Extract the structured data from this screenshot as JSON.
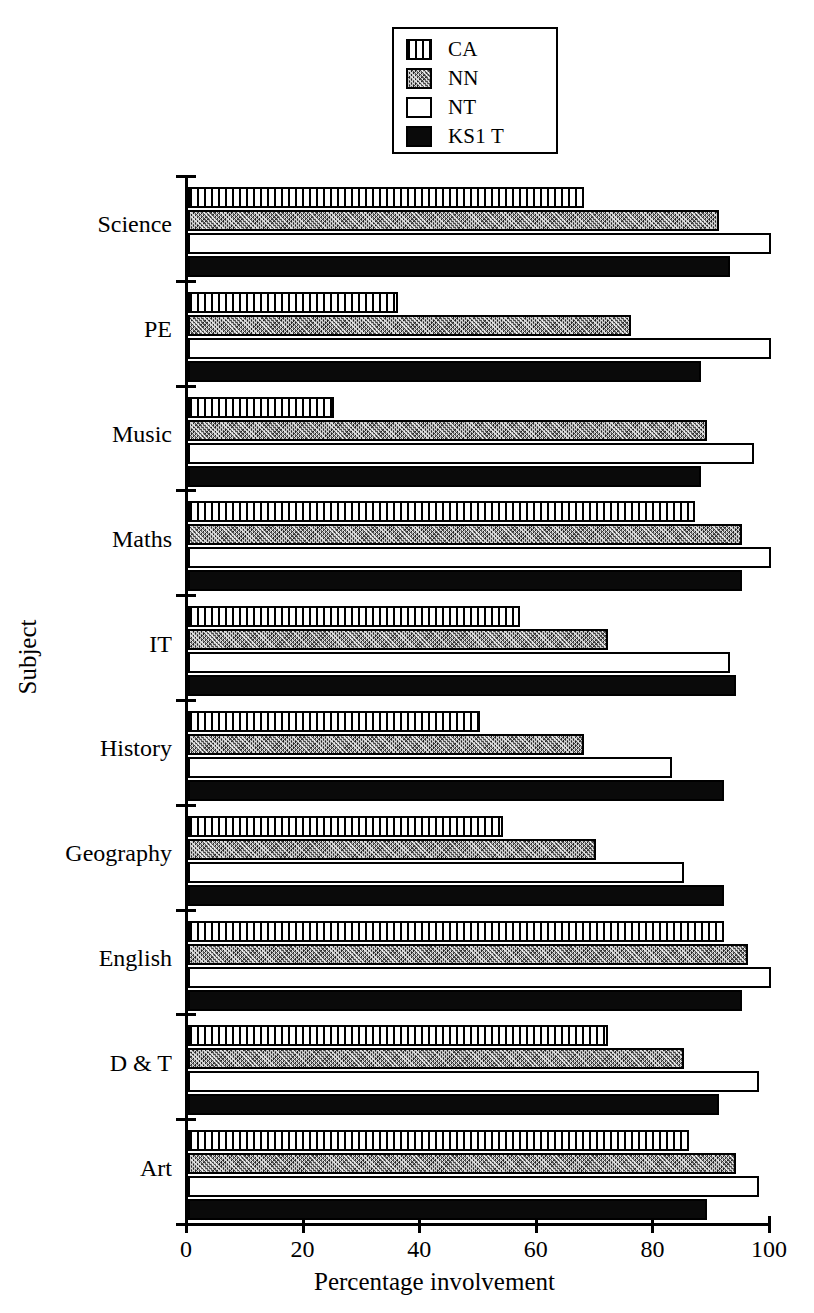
{
  "chart_data": {
    "type": "bar",
    "orientation": "horizontal",
    "title": "",
    "xlabel": "Percentage involvement",
    "ylabel": "Subject",
    "xlim": [
      0,
      100
    ],
    "xticks": [
      0,
      20,
      40,
      60,
      80,
      100
    ],
    "xtick_labels": [
      "0",
      "20",
      "40",
      "60",
      "80",
      "100"
    ],
    "grid": false,
    "legend_position": "top-center",
    "categories": [
      "Science",
      "PE",
      "Music",
      "Maths",
      "IT",
      "History",
      "Geography",
      "English",
      "D & T",
      "Art"
    ],
    "series": [
      {
        "name": "CA",
        "fill": "vertical-stripes",
        "values": [
          68,
          36,
          25,
          87,
          57,
          50,
          54,
          92,
          72,
          86
        ]
      },
      {
        "name": "NN",
        "fill": "stipple-grey",
        "values": [
          91,
          76,
          89,
          95,
          72,
          68,
          70,
          96,
          85,
          94
        ]
      },
      {
        "name": "NT",
        "fill": "white",
        "values": [
          100,
          100,
          97,
          100,
          93,
          83,
          85,
          100,
          98,
          98
        ]
      },
      {
        "name": "KS1 T",
        "fill": "solid-black",
        "values": [
          93,
          88,
          88,
          95,
          94,
          92,
          92,
          95,
          91,
          89
        ]
      }
    ]
  },
  "legend": {
    "items": [
      {
        "label": "CA"
      },
      {
        "label": "NN"
      },
      {
        "label": "NT"
      },
      {
        "label": "KS1 T"
      }
    ]
  },
  "colors": {
    "axis": "#000000",
    "ks1t": "#0a0a0a",
    "nn": "#8f8f8f",
    "nt": "#ffffff",
    "background": "#ffffff"
  }
}
